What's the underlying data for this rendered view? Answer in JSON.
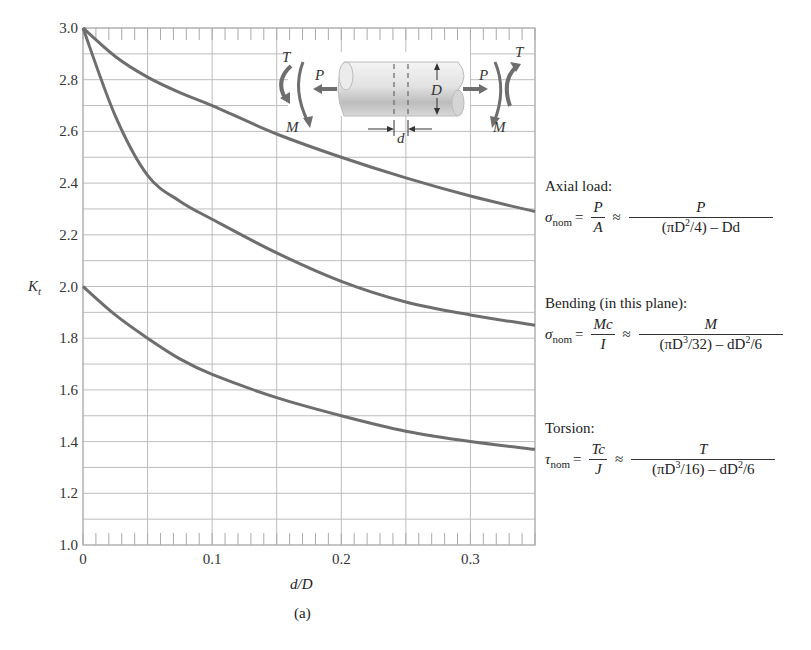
{
  "chart_data": {
    "type": "line",
    "title": "",
    "subfigure_label": "(a)",
    "xlabel": "d/D",
    "ylabel": "K_t",
    "xlim": [
      0,
      0.35
    ],
    "ylim": [
      1.0,
      3.0
    ],
    "x_ticks": [
      0,
      0.1,
      0.2,
      0.3
    ],
    "x_tick_labels": [
      "0",
      "0.1",
      "0.2",
      "0.3"
    ],
    "y_ticks": [
      1.0,
      1.2,
      1.4,
      1.6,
      1.8,
      2.0,
      2.2,
      2.4,
      2.6,
      2.8,
      3.0
    ],
    "y_tick_labels": [
      "1.0",
      "1.2",
      "1.4",
      "1.6",
      "1.8",
      "2.0",
      "2.2",
      "2.4",
      "2.6",
      "2.8",
      "3.0"
    ],
    "grid": true,
    "grid_minor_x": 0.05,
    "grid_minor_y": 0.1,
    "line_color": "#6e6e6e",
    "grid_color": "#bdbdbd",
    "x": [
      0,
      0.025,
      0.05,
      0.075,
      0.1,
      0.15,
      0.2,
      0.25,
      0.3,
      0.35
    ],
    "series": [
      {
        "name": "Axial load",
        "values": [
          3.0,
          2.89,
          2.81,
          2.75,
          2.7,
          2.59,
          2.5,
          2.42,
          2.35,
          2.29
        ]
      },
      {
        "name": "Bending (in this plane)",
        "values": [
          3.0,
          2.66,
          2.43,
          2.33,
          2.26,
          2.13,
          2.02,
          1.94,
          1.89,
          1.85
        ]
      },
      {
        "name": "Torsion",
        "values": [
          2.0,
          1.89,
          1.8,
          1.72,
          1.66,
          1.57,
          1.5,
          1.44,
          1.4,
          1.37
        ]
      }
    ],
    "legend_position": "right (formula annotations)"
  },
  "axes": {
    "ylabel_main": "K",
    "ylabel_sub": "t",
    "xlabel": "d/D",
    "caption": "(a)"
  },
  "diagram": {
    "labels": {
      "T_left": "T",
      "M_left": "M",
      "P_left": "P",
      "D": "D",
      "d": "d",
      "P_right": "P",
      "T_right": "T",
      "M_right": "M"
    }
  },
  "formulas": {
    "axial": {
      "heading": "Axial load:",
      "lhs": "σ",
      "lhs_sub": "nom",
      "eq": "=",
      "approx": "≈",
      "frac1_num": "P",
      "frac1_den": "A",
      "frac2_num": "P",
      "frac2_den_a": "(πD",
      "frac2_den_sup": "2",
      "frac2_den_b": "/4) – Dd"
    },
    "bending": {
      "heading": "Bending (in this plane):",
      "lhs": "σ",
      "lhs_sub": "nom",
      "eq": "=",
      "approx": "≈",
      "frac1_num": "Mc",
      "frac1_den": "I",
      "frac2_num": "M",
      "frac2_den_a": "(πD",
      "frac2_den_sup": "3",
      "frac2_den_b": "/32) – dD",
      "frac2_den_sup2": "2",
      "frac2_den_c": "/6"
    },
    "torsion": {
      "heading": "Torsion:",
      "lhs": "τ",
      "lhs_sub": "nom",
      "eq": "=",
      "approx": "≈",
      "frac1_num": "Tc",
      "frac1_den": "J",
      "frac2_num": "T",
      "frac2_den_a": "(πD",
      "frac2_den_sup": "3",
      "frac2_den_b": "/16) – dD",
      "frac2_den_sup2": "2",
      "frac2_den_c": "/6"
    }
  }
}
